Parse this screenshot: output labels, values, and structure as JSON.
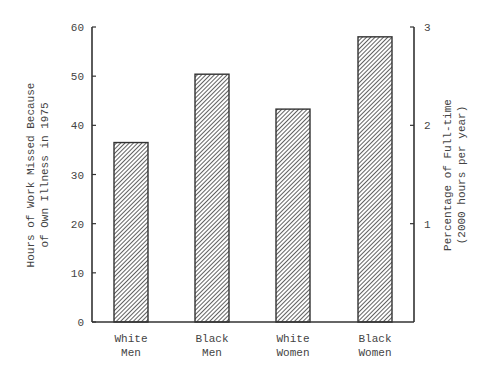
{
  "chart_data": {
    "type": "bar",
    "title": "",
    "categories": [
      {
        "line1": "White",
        "line2": "Men"
      },
      {
        "line1": "Black",
        "line2": "Men"
      },
      {
        "line1": "White",
        "line2": "Women"
      },
      {
        "line1": "Black",
        "line2": "Women"
      }
    ],
    "category_names": [
      "White Men",
      "Black Men",
      "White Women",
      "Black Women"
    ],
    "values": [
      36.5,
      50.4,
      43.3,
      58
    ],
    "xlabel": "",
    "ylabel": {
      "line1": "Hours of Work Missed Because",
      "line2": "of Own Illness in 1975"
    },
    "ylim": [
      0,
      60
    ],
    "yticks": [
      0,
      10,
      20,
      30,
      40,
      50,
      60
    ],
    "y2label": {
      "line1": "Percentage of Full-time",
      "line2": "(2000 hours per year)"
    },
    "y2lim": [
      0,
      3
    ],
    "y2ticks": [
      1,
      2,
      3
    ],
    "grid": false,
    "legend": null,
    "bar_fill": "diagonal-hatch",
    "colors": {
      "stroke": "#333333",
      "hatch": "#444444",
      "background": "#ffffff"
    }
  }
}
